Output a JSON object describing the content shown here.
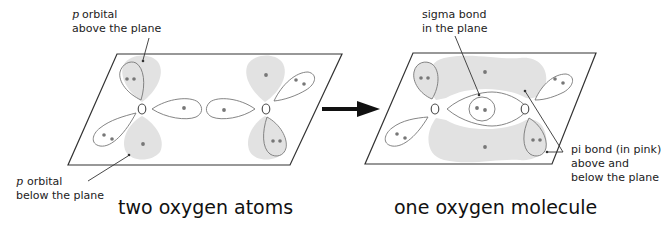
{
  "diagram": {
    "title_left": "two oxygen atoms",
    "title_right": "one oxygen molecule",
    "colors": {
      "lobe_shade": "#e2e2e2",
      "outline": "#333333",
      "electron": "#777777",
      "arrow": "#111111"
    },
    "left_panel": {
      "annotations": {
        "p_above": {
          "symbol": "p",
          "line1": "orbital",
          "line2": "above the plane"
        },
        "p_below": {
          "symbol": "p",
          "line1": "orbital",
          "line2": "below the plane"
        }
      },
      "atoms": [
        {
          "label": "O",
          "lone_pairs": 2,
          "unpaired_in_plane": 1,
          "unpaired_p": 1
        },
        {
          "label": "O",
          "lone_pairs": 2,
          "unpaired_in_plane": 1,
          "unpaired_p": 1
        }
      ]
    },
    "right_panel": {
      "annotations": {
        "sigma": {
          "line1": "sigma bond",
          "line2": "in the plane"
        },
        "pi": {
          "line1": "pi bond (in pink)",
          "line2": "above and",
          "line3": "below the plane"
        }
      },
      "atoms": [
        {
          "label": "O",
          "lone_pairs": 2
        },
        {
          "label": "O",
          "lone_pairs": 2
        }
      ],
      "bonds": [
        {
          "type": "sigma",
          "electrons": 2
        },
        {
          "type": "pi",
          "electrons": 2
        }
      ]
    },
    "transition_arrow": "right-arrow"
  }
}
